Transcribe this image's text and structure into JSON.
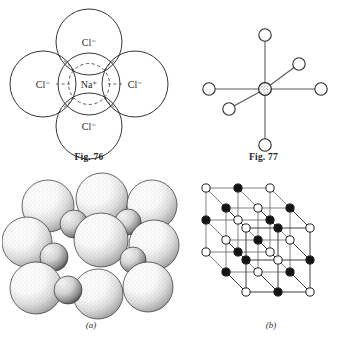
{
  "document": {
    "kind": "textbook-figure-plate",
    "subject": "Sodium chloride crystal structure"
  },
  "figures": [
    {
      "id": "fig-76",
      "caption": "Fig. 76",
      "type": "planar-coordination-diagram",
      "description": "Central sodium ion surrounded by four chloride ions in a plane",
      "center_ion": {
        "symbol": "Na",
        "charge": "+",
        "label": "Na⁺"
      },
      "surrounding_ions": [
        {
          "symbol": "Cl",
          "charge": "−",
          "label": "Cl⁻",
          "position": "top"
        },
        {
          "symbol": "Cl",
          "charge": "−",
          "label": "Cl⁻",
          "position": "left"
        },
        {
          "symbol": "Cl",
          "charge": "−",
          "label": "Cl⁻",
          "position": "right"
        },
        {
          "symbol": "Cl",
          "charge": "−",
          "label": "Cl⁻",
          "position": "bottom"
        }
      ],
      "coordination_number": 4
    },
    {
      "id": "fig-77",
      "caption": "Fig. 77",
      "type": "octahedral-skeleton-diagram",
      "description": "Central shaded ion bonded to six open-circle ions in octahedral geometry",
      "center_node": {
        "style": "shaded",
        "label": ""
      },
      "ligand_nodes": [
        {
          "direction": "up",
          "style": "open"
        },
        {
          "direction": "down",
          "style": "open"
        },
        {
          "direction": "left",
          "style": "open"
        },
        {
          "direction": "right",
          "style": "open"
        },
        {
          "direction": "back-upper-right",
          "style": "open"
        },
        {
          "direction": "front-lower-left",
          "style": "open"
        }
      ],
      "coordination_number": 6
    },
    {
      "id": "fig-a",
      "caption": "(a)",
      "type": "space-filling-model",
      "description": "Stippled space-filling spheres showing close packing of large chloride and small sodium ions",
      "large_sphere_species": "Cl⁻",
      "small_sphere_species": "Na⁺"
    },
    {
      "id": "fig-b",
      "caption": "(b)",
      "type": "ball-and-stick-lattice",
      "description": "Three dimensional cubic lattice of alternating filled and open circles joined by rods",
      "lattice_size": "3 x 3 x 3",
      "filled_node_species": "Na⁺",
      "open_node_species": "Cl⁻"
    }
  ],
  "colors": {
    "background": "#ffffff",
    "ink": "#1a1a1a",
    "rod": "#555555",
    "shaded_fill": "#bfbfbf",
    "dashed": "#4a4a4a"
  }
}
